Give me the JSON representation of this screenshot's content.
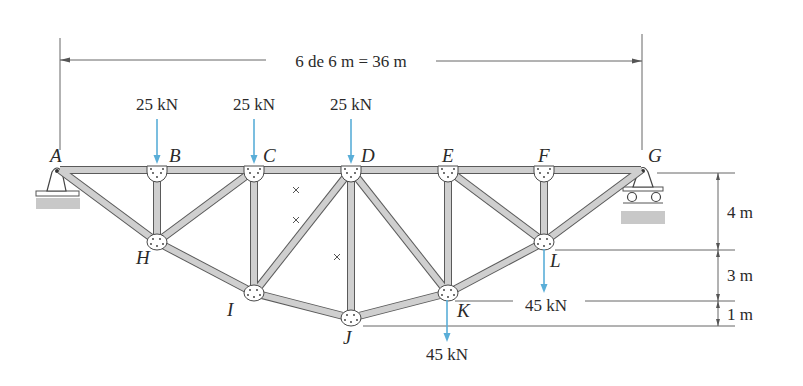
{
  "figure": {
    "span_label": "6 de 6 m = 36 m",
    "nodes": {
      "A": {
        "label": "A",
        "x": 60,
        "y": 170
      },
      "B": {
        "label": "B",
        "x": 157,
        "y": 170
      },
      "C": {
        "label": "C",
        "x": 254,
        "y": 170
      },
      "D": {
        "label": "D",
        "x": 351,
        "y": 170
      },
      "E": {
        "label": "E",
        "x": 448,
        "y": 170
      },
      "F": {
        "label": "F",
        "x": 544,
        "y": 170
      },
      "G": {
        "label": "G",
        "x": 641,
        "y": 170
      },
      "H": {
        "label": "H",
        "x": 157,
        "y": 242
      },
      "I": {
        "label": "I",
        "x": 254,
        "y": 293
      },
      "J": {
        "label": "J",
        "x": 351,
        "y": 318
      },
      "K": {
        "label": "K",
        "x": 448,
        "y": 293
      },
      "L": {
        "label": "L",
        "x": 544,
        "y": 242
      }
    },
    "members": [
      [
        "A",
        "B"
      ],
      [
        "B",
        "C"
      ],
      [
        "C",
        "D"
      ],
      [
        "D",
        "E"
      ],
      [
        "E",
        "F"
      ],
      [
        "F",
        "G"
      ],
      [
        "A",
        "H"
      ],
      [
        "H",
        "I"
      ],
      [
        "I",
        "J"
      ],
      [
        "J",
        "K"
      ],
      [
        "K",
        "L"
      ],
      [
        "L",
        "G"
      ],
      [
        "B",
        "H"
      ],
      [
        "C",
        "I"
      ],
      [
        "D",
        "J"
      ],
      [
        "E",
        "K"
      ],
      [
        "F",
        "L"
      ],
      [
        "H",
        "C"
      ],
      [
        "I",
        "D"
      ],
      [
        "D",
        "K"
      ],
      [
        "E",
        "L"
      ]
    ],
    "loads": [
      {
        "node": "B",
        "label": "25 kN",
        "direction": "down"
      },
      {
        "node": "C",
        "label": "25 kN",
        "direction": "down"
      },
      {
        "node": "D",
        "label": "25 kN",
        "direction": "down"
      },
      {
        "node": "K",
        "label": "45 kN",
        "direction": "down"
      },
      {
        "node": "L",
        "label": "45 kN",
        "direction": "down"
      }
    ],
    "vertical_dimensions": [
      {
        "label": "4 m"
      },
      {
        "label": "3 m"
      },
      {
        "label": "1 m"
      }
    ],
    "supports": {
      "A": "pin",
      "G": "roller"
    },
    "colors": {
      "load_arrow": "#5aaed8",
      "member_fill": "#cfcfcf",
      "member_edge": "#5a5a5a",
      "ground": "#c8c8c8"
    }
  }
}
